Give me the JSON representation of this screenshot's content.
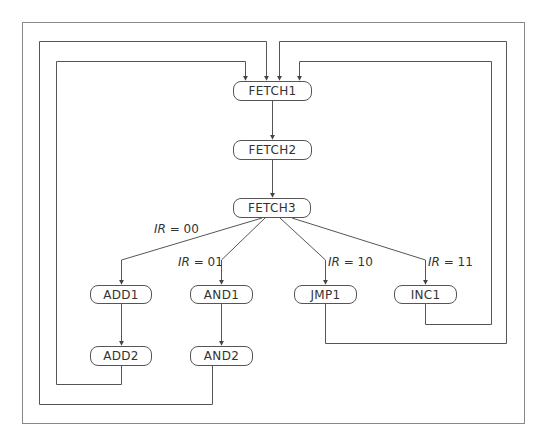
{
  "diagram": {
    "type": "state-machine",
    "nodes": {
      "fetch1": "FETCH1",
      "fetch2": "FETCH2",
      "fetch3": "FETCH3",
      "add1": "ADD1",
      "add2": "ADD2",
      "and1": "AND1",
      "and2": "AND2",
      "jmp1": "JMP1",
      "inc1": "INC1"
    },
    "edge_labels": {
      "ir00": {
        "var": "IR",
        "op": " = ",
        "val": "00"
      },
      "ir01": {
        "var": "IR",
        "op": " = ",
        "val": "01"
      },
      "ir10": {
        "var": "IR",
        "op": " = ",
        "val": "10"
      },
      "ir11": {
        "var": "IR",
        "op": " = ",
        "val": "11"
      }
    },
    "edges": [
      {
        "from": "FETCH1",
        "to": "FETCH2"
      },
      {
        "from": "FETCH2",
        "to": "FETCH3"
      },
      {
        "from": "FETCH3",
        "to": "ADD1",
        "label": "IR = 00"
      },
      {
        "from": "FETCH3",
        "to": "AND1",
        "label": "IR = 01"
      },
      {
        "from": "FETCH3",
        "to": "JMP1",
        "label": "IR = 10"
      },
      {
        "from": "FETCH3",
        "to": "INC1",
        "label": "IR = 11"
      },
      {
        "from": "ADD1",
        "to": "ADD2"
      },
      {
        "from": "AND1",
        "to": "AND2"
      },
      {
        "from": "ADD2",
        "to": "FETCH1"
      },
      {
        "from": "AND2",
        "to": "FETCH1"
      },
      {
        "from": "JMP1",
        "to": "FETCH1"
      },
      {
        "from": "INC1",
        "to": "FETCH1"
      }
    ],
    "colors": {
      "line": "#555555",
      "text": "#333333",
      "frame": "#777777"
    }
  }
}
